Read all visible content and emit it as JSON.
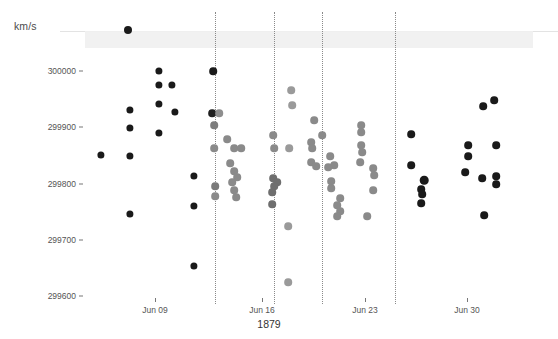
{
  "chart_data": {
    "type": "scatter",
    "title": "",
    "xlabel": "1879",
    "ylabel": "km/s",
    "ylim": [
      299600,
      300050
    ],
    "yticks": [
      300000,
      299900,
      299800,
      299700,
      299600
    ],
    "ytick_labels": [
      "300000",
      "299900",
      "299800",
      "299700",
      "299600"
    ],
    "xtick_labels": [
      "Jun 09",
      "Jun 16",
      "Jun 23",
      "Jun 30"
    ],
    "xtick_px": [
      155,
      262,
      365,
      467
    ],
    "gridlines_px": [
      215,
      274,
      322,
      395
    ],
    "grid": "vertical-dotted",
    "legend": "none",
    "banner_label": "",
    "points": [
      {
        "x": 128,
        "y": 30,
        "c": "#1a1a1a",
        "r": 4.0
      },
      {
        "x": 101,
        "y": 155,
        "c": "#1a1a1a",
        "r": 3.6
      },
      {
        "x": 130,
        "y": 110,
        "c": "#1a1a1a",
        "r": 3.6
      },
      {
        "x": 130,
        "y": 128,
        "c": "#1a1a1a",
        "r": 3.6
      },
      {
        "x": 130,
        "y": 156,
        "c": "#1a1a1a",
        "r": 3.6
      },
      {
        "x": 130,
        "y": 214,
        "c": "#1a1a1a",
        "r": 3.6
      },
      {
        "x": 159,
        "y": 71,
        "c": "#1a1a1a",
        "r": 3.6
      },
      {
        "x": 159,
        "y": 85,
        "c": "#1a1a1a",
        "r": 3.6
      },
      {
        "x": 172,
        "y": 85,
        "c": "#1a1a1a",
        "r": 3.6
      },
      {
        "x": 159,
        "y": 104,
        "c": "#1a1a1a",
        "r": 3.6
      },
      {
        "x": 175,
        "y": 112,
        "c": "#1a1a1a",
        "r": 3.6
      },
      {
        "x": 159,
        "y": 133,
        "c": "#1a1a1a",
        "r": 3.6
      },
      {
        "x": 194,
        "y": 176,
        "c": "#1a1a1a",
        "r": 3.6
      },
      {
        "x": 194,
        "y": 206,
        "c": "#1a1a1a",
        "r": 3.6
      },
      {
        "x": 194,
        "y": 266,
        "c": "#1a1a1a",
        "r": 3.6
      },
      {
        "x": 213,
        "y": 71,
        "c": "#1a1a1a",
        "r": 3.8
      },
      {
        "x": 212,
        "y": 113,
        "c": "#1f1f1f",
        "r": 3.8
      },
      {
        "x": 219,
        "y": 113,
        "c": "#8e8e8e",
        "r": 3.8
      },
      {
        "x": 214,
        "y": 125,
        "c": "#7d7d7d",
        "r": 3.8
      },
      {
        "x": 214,
        "y": 148,
        "c": "#8a8a8a",
        "r": 3.8
      },
      {
        "x": 227,
        "y": 139,
        "c": "#8a8a8a",
        "r": 3.8
      },
      {
        "x": 234,
        "y": 148,
        "c": "#8a8a8a",
        "r": 3.8
      },
      {
        "x": 241,
        "y": 148,
        "c": "#8a8a8a",
        "r": 3.8
      },
      {
        "x": 230,
        "y": 163,
        "c": "#8a8a8a",
        "r": 3.8
      },
      {
        "x": 234,
        "y": 171,
        "c": "#8a8a8a",
        "r": 3.8
      },
      {
        "x": 237,
        "y": 177,
        "c": "#8a8a8a",
        "r": 3.8
      },
      {
        "x": 232,
        "y": 182,
        "c": "#8a8a8a",
        "r": 3.8
      },
      {
        "x": 215,
        "y": 186,
        "c": "#7a7a7a",
        "r": 3.8
      },
      {
        "x": 234,
        "y": 190,
        "c": "#8a8a8a",
        "r": 3.8
      },
      {
        "x": 215,
        "y": 196,
        "c": "#8a8a8a",
        "r": 3.8
      },
      {
        "x": 236,
        "y": 197,
        "c": "#8a8a8a",
        "r": 3.8
      },
      {
        "x": 291,
        "y": 90,
        "c": "#9a9a9a",
        "r": 3.8
      },
      {
        "x": 292,
        "y": 105,
        "c": "#9a9a9a",
        "r": 3.8
      },
      {
        "x": 273,
        "y": 135,
        "c": "#8a8a8a",
        "r": 3.8
      },
      {
        "x": 274,
        "y": 148,
        "c": "#8a8a8a",
        "r": 3.8
      },
      {
        "x": 289,
        "y": 148,
        "c": "#9a9a9a",
        "r": 3.8
      },
      {
        "x": 273,
        "y": 178,
        "c": "#6e6e6e",
        "r": 3.8
      },
      {
        "x": 277,
        "y": 182,
        "c": "#6e6e6e",
        "r": 3.8
      },
      {
        "x": 274,
        "y": 186,
        "c": "#6e6e6e",
        "r": 3.8
      },
      {
        "x": 272,
        "y": 192,
        "c": "#6e6e6e",
        "r": 3.8
      },
      {
        "x": 272,
        "y": 204,
        "c": "#6e6e6e",
        "r": 3.8
      },
      {
        "x": 288,
        "y": 226,
        "c": "#9a9a9a",
        "r": 3.8
      },
      {
        "x": 288,
        "y": 282,
        "c": "#9a9a9a",
        "r": 3.8
      },
      {
        "x": 314,
        "y": 120,
        "c": "#8a8a8a",
        "r": 3.8
      },
      {
        "x": 311,
        "y": 142,
        "c": "#8a8a8a",
        "r": 3.8
      },
      {
        "x": 312,
        "y": 148,
        "c": "#8a8a8a",
        "r": 3.8
      },
      {
        "x": 311,
        "y": 162,
        "c": "#8a8a8a",
        "r": 3.8
      },
      {
        "x": 316,
        "y": 166,
        "c": "#8a8a8a",
        "r": 3.8
      },
      {
        "x": 322,
        "y": 135,
        "c": "#8a8a8a",
        "r": 3.8
      },
      {
        "x": 330,
        "y": 156,
        "c": "#8a8a8a",
        "r": 3.8
      },
      {
        "x": 334,
        "y": 165,
        "c": "#8a8a8a",
        "r": 3.8
      },
      {
        "x": 328,
        "y": 167,
        "c": "#8a8a8a",
        "r": 3.8
      },
      {
        "x": 331,
        "y": 181,
        "c": "#8a8a8a",
        "r": 3.8
      },
      {
        "x": 331,
        "y": 188,
        "c": "#8a8a8a",
        "r": 3.8
      },
      {
        "x": 340,
        "y": 198,
        "c": "#8a8a8a",
        "r": 3.8
      },
      {
        "x": 337,
        "y": 205,
        "c": "#8a8a8a",
        "r": 3.8
      },
      {
        "x": 340,
        "y": 211,
        "c": "#8a8a8a",
        "r": 3.8
      },
      {
        "x": 337,
        "y": 216,
        "c": "#8a8a8a",
        "r": 3.8
      },
      {
        "x": 361,
        "y": 125,
        "c": "#8a8a8a",
        "r": 3.8
      },
      {
        "x": 361,
        "y": 132,
        "c": "#8a8a8a",
        "r": 3.8
      },
      {
        "x": 361,
        "y": 145,
        "c": "#8a8a8a",
        "r": 3.8
      },
      {
        "x": 362,
        "y": 152,
        "c": "#8a8a8a",
        "r": 3.8
      },
      {
        "x": 360,
        "y": 162,
        "c": "#8a8a8a",
        "r": 3.8
      },
      {
        "x": 373,
        "y": 168,
        "c": "#8a8a8a",
        "r": 3.8
      },
      {
        "x": 374,
        "y": 175,
        "c": "#8a8a8a",
        "r": 3.8
      },
      {
        "x": 373,
        "y": 190,
        "c": "#8a8a8a",
        "r": 3.8
      },
      {
        "x": 367,
        "y": 216,
        "c": "#8a8a8a",
        "r": 3.8
      },
      {
        "x": 411,
        "y": 134,
        "c": "#1a1a1a",
        "r": 3.8
      },
      {
        "x": 411,
        "y": 165,
        "c": "#1a1a1a",
        "r": 3.8
      },
      {
        "x": 424,
        "y": 180,
        "c": "#1a1a1a",
        "r": 4.3
      },
      {
        "x": 421,
        "y": 189,
        "c": "#1a1a1a",
        "r": 3.8
      },
      {
        "x": 422,
        "y": 194,
        "c": "#1a1a1a",
        "r": 3.8
      },
      {
        "x": 421,
        "y": 203,
        "c": "#1a1a1a",
        "r": 3.8
      },
      {
        "x": 483,
        "y": 106,
        "c": "#1a1a1a",
        "r": 3.8
      },
      {
        "x": 494,
        "y": 100,
        "c": "#1a1a1a",
        "r": 3.8
      },
      {
        "x": 468,
        "y": 145,
        "c": "#1a1a1a",
        "r": 3.8
      },
      {
        "x": 496,
        "y": 145,
        "c": "#1a1a1a",
        "r": 3.8
      },
      {
        "x": 468,
        "y": 156,
        "c": "#1a1a1a",
        "r": 3.8
      },
      {
        "x": 465,
        "y": 172,
        "c": "#1a1a1a",
        "r": 3.8
      },
      {
        "x": 482,
        "y": 178,
        "c": "#1a1a1a",
        "r": 3.8
      },
      {
        "x": 496,
        "y": 176,
        "c": "#1a1a1a",
        "r": 3.8
      },
      {
        "x": 496,
        "y": 184,
        "c": "#1a1a1a",
        "r": 3.8
      },
      {
        "x": 484,
        "y": 215,
        "c": "#1a1a1a",
        "r": 3.8
      }
    ]
  },
  "axes": {
    "y_title": "km/s",
    "x_title": "1879"
  },
  "colors": {
    "point_dark": "#1a1a1a",
    "point_mid": "#8a8a8a",
    "point_light": "#9a9a9a",
    "gridline": "#8a8a8a",
    "band": "#f0f0f0",
    "tick_text": "#555555",
    "background": "#ffffff"
  }
}
